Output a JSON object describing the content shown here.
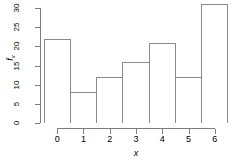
{
  "chart_data": {
    "type": "bar",
    "title": "",
    "subtitle": "",
    "categories": [
      "0",
      "1",
      "2",
      "3",
      "4",
      "5",
      "6"
    ],
    "values": [
      22,
      8,
      12,
      16,
      21,
      12,
      31
    ],
    "xlabel": "x",
    "ylabel": "f",
    "ylabel_subscript": "x",
    "ylim": [
      0,
      30
    ],
    "xlim": [
      -0.5,
      6.5
    ],
    "yticks": [
      0,
      5,
      10,
      15,
      20,
      25,
      30
    ],
    "ytick_labels": [
      "0",
      "5",
      "10",
      "15",
      "20",
      "25",
      "30"
    ],
    "xticks": [
      0,
      1,
      2,
      3,
      4,
      5,
      6
    ],
    "xtick_labels": [
      "0",
      "1",
      "2",
      "3",
      "4",
      "5",
      "6"
    ],
    "grid": false,
    "legend": null,
    "bar_fill_color": "#ffffff",
    "bar_border_color": "#8a8a8a",
    "axis_color": "#7d7d7d",
    "background_color": "#ffffff",
    "bar_width": 1,
    "annotations": []
  }
}
